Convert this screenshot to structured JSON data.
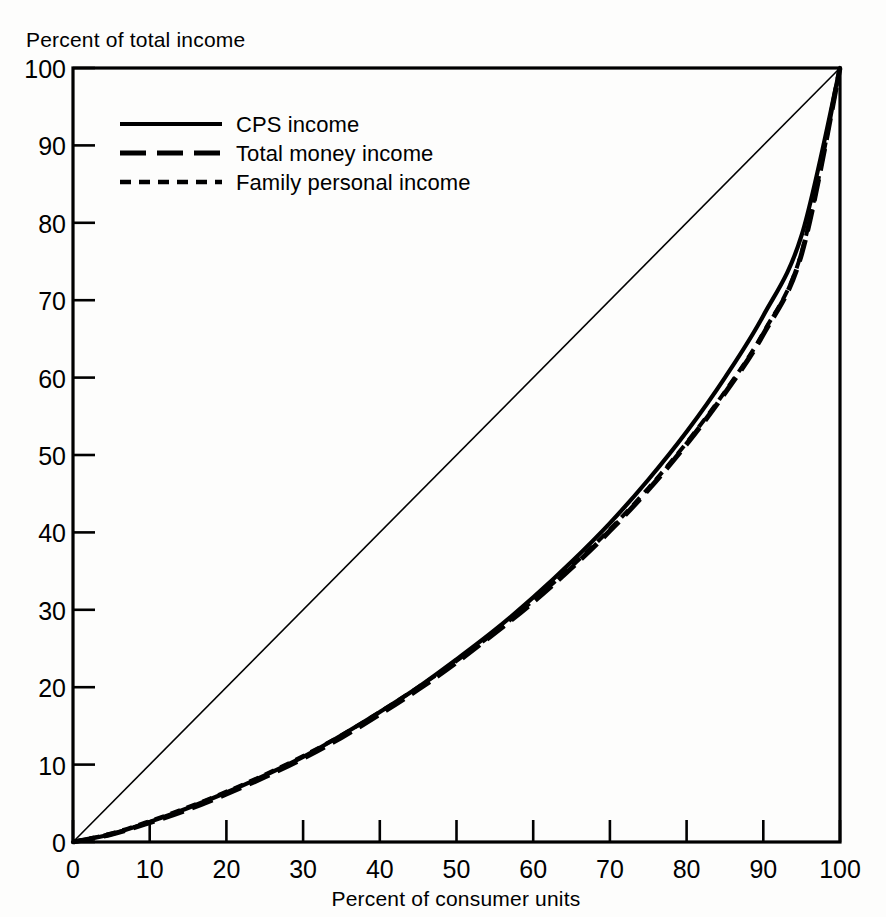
{
  "chart_data": {
    "type": "line",
    "title": "",
    "subtitle": "",
    "xlabel": "Percent of consumer units",
    "ylabel": "Percent of total income",
    "xlim": [
      0,
      100
    ],
    "ylim": [
      0,
      100
    ],
    "xticks": [
      0,
      10,
      20,
      30,
      40,
      50,
      60,
      70,
      80,
      90,
      100
    ],
    "yticks": [
      0,
      10,
      20,
      30,
      40,
      50,
      60,
      70,
      80,
      90,
      100
    ],
    "xtick_labels": [
      "0",
      "10",
      "20",
      "30",
      "40",
      "50",
      "60",
      "70",
      "80",
      "90",
      "100"
    ],
    "ytick_labels": [
      "0",
      "10",
      "20",
      "30",
      "40",
      "50",
      "60",
      "70",
      "80",
      "90",
      "100"
    ],
    "grid": false,
    "legend_position": "upper-left-inside",
    "x": [
      0,
      5,
      10,
      15,
      20,
      25,
      30,
      35,
      40,
      45,
      50,
      55,
      60,
      65,
      70,
      75,
      80,
      85,
      90,
      95,
      100
    ],
    "series": [
      {
        "name": "CPS income",
        "style": "solid",
        "values": [
          0,
          1.0,
          2.6,
          4.4,
          6.4,
          8.6,
          11.0,
          13.8,
          16.8,
          20.0,
          23.6,
          27.4,
          31.6,
          36.2,
          41.2,
          46.8,
          53.0,
          60.0,
          68.0,
          78.4,
          100
        ]
      },
      {
        "name": "Total money income",
        "style": "long-dash",
        "values": [
          0,
          1.0,
          2.5,
          4.2,
          6.2,
          8.4,
          10.8,
          13.5,
          16.5,
          19.7,
          23.2,
          27.0,
          31.0,
          35.4,
          40.2,
          45.5,
          51.4,
          58.0,
          65.6,
          76.0,
          100
        ]
      },
      {
        "name": "Family personal income",
        "style": "short-dash",
        "values": [
          0,
          1.1,
          2.7,
          4.5,
          6.5,
          8.7,
          11.1,
          13.8,
          16.8,
          20.0,
          23.4,
          27.1,
          31.2,
          35.6,
          40.4,
          45.7,
          51.6,
          58.2,
          65.8,
          76.2,
          100
        ]
      }
    ],
    "reference_line": {
      "name": "line of equality",
      "from": [
        0,
        0
      ],
      "to": [
        100,
        100
      ],
      "style": "thin-solid"
    }
  },
  "legend": {
    "items": [
      {
        "label": "CPS income",
        "style": "solid"
      },
      {
        "label": "Total money income",
        "style": "long-dash"
      },
      {
        "label": "Family personal income",
        "style": "short-dash"
      }
    ]
  },
  "axes": {
    "y_title": "Percent of total income",
    "x_title": "Percent of consumer units"
  }
}
